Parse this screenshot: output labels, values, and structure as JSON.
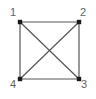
{
  "figure": {
    "name": "complete-graph-k4",
    "background_color": "#ffffff",
    "width": 96,
    "height": 99
  },
  "style": {
    "edge_color": "#555555",
    "edge_width": 1.2,
    "vertex_color": "#1a1a1a",
    "vertex_size": 4.4,
    "vertex_shape": "square",
    "label_color": "#5f5f5f",
    "label_font_size": 11
  },
  "chart_data": {
    "type": "diagram",
    "title": "",
    "graph_type": "complete-graph",
    "node_count": 4,
    "edge_count": 6,
    "nodes": [
      {
        "id": "1",
        "label": "1",
        "x": 20,
        "y": 22,
        "label_x": 10,
        "label_y": 7
      },
      {
        "id": "2",
        "label": "2",
        "x": 79,
        "y": 22,
        "label_x": 80,
        "label_y": 7
      },
      {
        "id": "3",
        "label": "3",
        "x": 79,
        "y": 79,
        "label_x": 81,
        "label_y": 79
      },
      {
        "id": "4",
        "label": "4",
        "x": 20,
        "y": 79,
        "label_x": 10,
        "label_y": 79
      }
    ],
    "edges": [
      {
        "from": "1",
        "to": "2",
        "kind": "side"
      },
      {
        "from": "2",
        "to": "3",
        "kind": "side"
      },
      {
        "from": "3",
        "to": "4",
        "kind": "side"
      },
      {
        "from": "4",
        "to": "1",
        "kind": "side"
      },
      {
        "from": "1",
        "to": "3",
        "kind": "diagonal"
      },
      {
        "from": "2",
        "to": "4",
        "kind": "diagonal"
      }
    ]
  },
  "labels": {
    "node1": "1",
    "node2": "2",
    "node3": "3",
    "node4": "4"
  }
}
